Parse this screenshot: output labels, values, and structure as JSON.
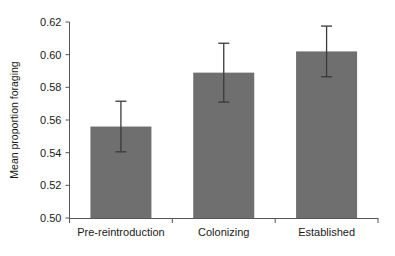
{
  "chart_data": {
    "type": "bar",
    "title": "",
    "xlabel": "",
    "ylabel": "Mean proportion foraging",
    "categories": [
      "Pre-reintroduction",
      "Colonizing",
      "Established"
    ],
    "values": [
      0.556,
      0.589,
      0.602
    ],
    "errors": [
      0.0155,
      0.018,
      0.0155
    ],
    "error_type": "standard error",
    "ylim": [
      0.5,
      0.62
    ],
    "yticks": [
      "0.50",
      "0.52",
      "0.54",
      "0.56",
      "0.58",
      "0.60",
      "0.62"
    ],
    "ytick_values": [
      0.5,
      0.52,
      0.54,
      0.56,
      0.58,
      0.6,
      0.62
    ],
    "grid": false,
    "legend": "none",
    "bar_color": "#706f70",
    "axis_color": "#555555",
    "error_bar_color": "#3a3a3a"
  }
}
